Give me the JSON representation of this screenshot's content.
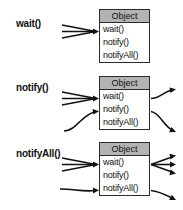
{
  "diagram": {
    "box_title": "Object",
    "methods": [
      "wait()",
      "notify()",
      "notifyAll()"
    ],
    "colors": {
      "header_fill": "#b3b3b3",
      "box_fill": "#ffffff",
      "stroke": "#111111",
      "background": "#ffffff"
    },
    "panels": [
      {
        "label": "wait()",
        "box_title": "Object",
        "rows": [
          "wait()",
          "notify()",
          "notifyAll()"
        ],
        "incoming_count": 3,
        "incoming_target": "wait()",
        "outgoing_count": 0,
        "outgoing_sources": []
      },
      {
        "label": "notify()",
        "box_title": "Object",
        "rows": [
          "wait()",
          "notify()",
          "notifyAll()"
        ],
        "incoming_count": 3,
        "incoming_target": "wait()",
        "outgoing_count": 2,
        "outgoing_sources": [
          "wait()",
          "notify()"
        ],
        "caller_arrow_target": "notify()"
      },
      {
        "label": "notifyAll()",
        "box_title": "Object",
        "rows": [
          "wait()",
          "notify()",
          "notifyAll()"
        ],
        "incoming_count": 3,
        "incoming_target": "wait()",
        "outgoing_count": 4,
        "outgoing_sources": [
          "wait()",
          "wait()",
          "wait()",
          "notifyAll()"
        ],
        "caller_arrow_target": "notifyAll()"
      }
    ]
  }
}
